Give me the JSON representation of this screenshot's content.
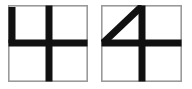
{
  "canvas": {
    "width": 192,
    "height": 89,
    "background_color": "#ffffff"
  },
  "figures": [
    {
      "id": "blocky-four",
      "label": "4",
      "style": "blocky",
      "description": "Digit four drawn with straight strokes inside a bordered square",
      "box": {
        "x": 8,
        "y": 5,
        "width": 80,
        "height": 77
      },
      "frame_color": "#9a9a9a",
      "frame_width": 1.6,
      "stroke_color": "#111111",
      "stroke_width": 7,
      "strokes": [
        {
          "name": "left-vertical-stroke",
          "type": "line",
          "x1": 4.0,
          "y1": 2.0,
          "x2": 4.0,
          "y2": 38.0
        },
        {
          "name": "horizontal-crossbar",
          "type": "line",
          "x1": 0.5,
          "y1": 38.0,
          "x2": 79.5,
          "y2": 38.0
        },
        {
          "name": "center-vertical-stem",
          "type": "line",
          "x1": 41.0,
          "y1": 0.5,
          "x2": 41.0,
          "y2": 76.5
        }
      ]
    },
    {
      "id": "diagonal-four",
      "label": "4",
      "style": "diagonal",
      "description": "Digit four drawn with a diagonal stroke inside a bordered square",
      "box": {
        "x": 101,
        "y": 5,
        "width": 81,
        "height": 77
      },
      "frame_color": "#9a9a9a",
      "frame_width": 1.6,
      "stroke_color": "#111111",
      "stroke_width": 7,
      "strokes": [
        {
          "name": "diagonal-stroke",
          "type": "line",
          "x1": 2.0,
          "y1": 38.0,
          "x2": 41.0,
          "y2": 1.0
        },
        {
          "name": "horizontal-crossbar",
          "type": "line",
          "x1": 0.5,
          "y1": 38.0,
          "x2": 80.5,
          "y2": 38.0
        },
        {
          "name": "center-vertical-stem",
          "type": "line",
          "x1": 41.0,
          "y1": 0.5,
          "x2": 41.0,
          "y2": 76.5
        }
      ]
    }
  ]
}
